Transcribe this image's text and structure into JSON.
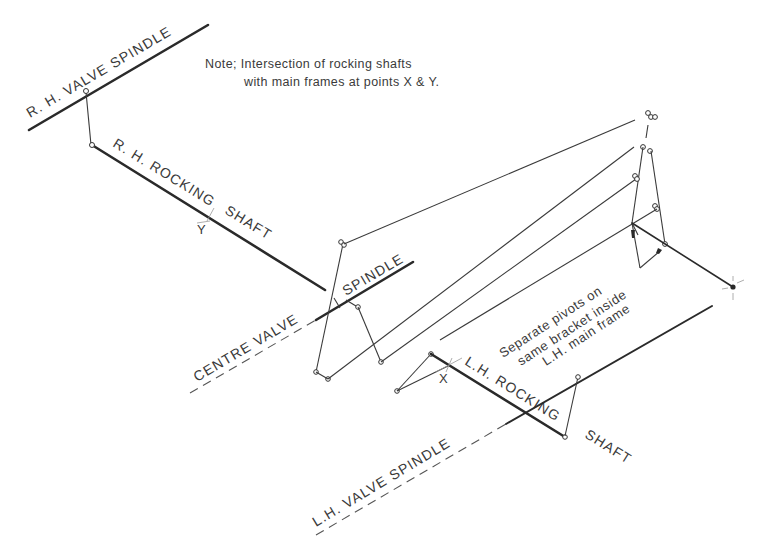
{
  "diagram": {
    "note": {
      "line1": "Note; Intersection of rocking shafts",
      "line2": "with main frames at points X & Y."
    },
    "labels": {
      "rh_valve_spindle": "R. H. VALVE SPINDLE",
      "rh_rocking_shaft_a": "R. H. ROCKING",
      "rh_rocking_shaft_b": "SHAFT",
      "point_y": "Y",
      "centre_valve": "CENTRE VALVE",
      "centre_spindle": "SPINDLE",
      "point_x": "X",
      "lh_rocking_a": "L.H. ROCKING",
      "lh_rocking_b": "SHAFT",
      "lh_valve_spindle": "L.H. VALVE SPINDLE",
      "pivots_line1": "Separate pivots on",
      "pivots_line2": "same bracket inside",
      "pivots_line3": "L.H. main frame"
    },
    "colors": {
      "line": "#2a2a2a",
      "text": "#3a3a3a",
      "background": "#ffffff"
    }
  }
}
